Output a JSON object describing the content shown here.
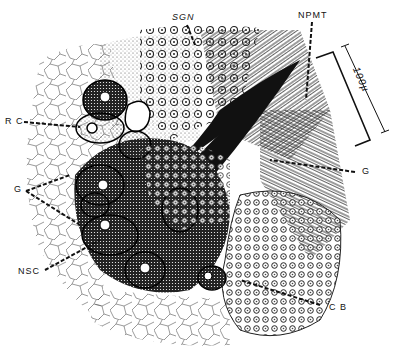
{
  "figure": {
    "type": "histological illustration",
    "labels": [
      {
        "id": "SGN",
        "text": "SGN",
        "x": 172,
        "y": 12
      },
      {
        "id": "NPMT",
        "text": "NPMT",
        "x": 298,
        "y": 10
      },
      {
        "id": "RC",
        "text": "R C",
        "x": 5,
        "y": 118
      },
      {
        "id": "G_left",
        "text": "G",
        "x": 14,
        "y": 183
      },
      {
        "id": "G_right",
        "text": "G",
        "x": 362,
        "y": 167
      },
      {
        "id": "NSC",
        "text": "NSC",
        "x": 18,
        "y": 266
      },
      {
        "id": "CB",
        "text": "C B",
        "x": 329,
        "y": 303
      }
    ],
    "scale_bar": {
      "text": "100µ",
      "x": 342,
      "y": 66
    }
  }
}
